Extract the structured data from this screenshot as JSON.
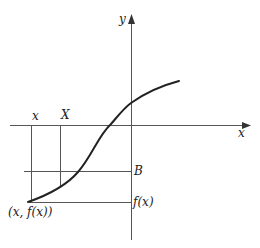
{
  "diagram": {
    "axes": {
      "x_label": "x",
      "y_label": "y"
    },
    "labels": {
      "small_x": "x",
      "big_X": "X",
      "B": "B",
      "fx": "f(x)",
      "point": "(x, f(x))"
    },
    "colors": {
      "curve": "#222222",
      "lines": "#555555",
      "text": "#222222"
    }
  }
}
